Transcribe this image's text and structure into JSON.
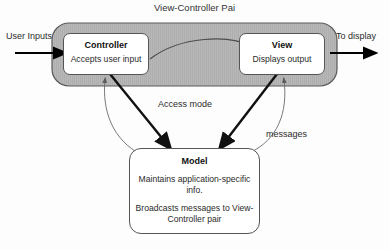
{
  "diagram": {
    "title": "View-Controller Pai",
    "type": "mvc-architecture-diagram",
    "colors": {
      "container_fill": "#b5b5b5",
      "box_fill": "#ffffff",
      "stroke": "#555555",
      "arrow_thick": "#000000",
      "arrow_thin": "#666666",
      "text": "#2b2b2b",
      "background": "#fdfdfd"
    },
    "external_labels": {
      "user_inputs": "User Inputs",
      "to_display": "To display"
    },
    "edge_labels": {
      "access_mode": "Access mode",
      "messages": "messages"
    },
    "nodes": {
      "controller": {
        "title": "Controller",
        "description": "Accepts user input"
      },
      "view": {
        "title": "View",
        "description": "Displays output"
      },
      "model": {
        "title": "Model",
        "description_1": "Maintains application-specific info.",
        "description_2": "Broadcasts messages to View-Controller pair"
      }
    },
    "icons": {
      "arrow_in": "arrow-right-icon",
      "arrow_out": "arrow-right-icon",
      "arrow_to_model": "arrow-down-icon",
      "arrow_from_model": "arrow-up-icon",
      "arrow_controller_to_view": "curved-arrow-icon"
    }
  }
}
